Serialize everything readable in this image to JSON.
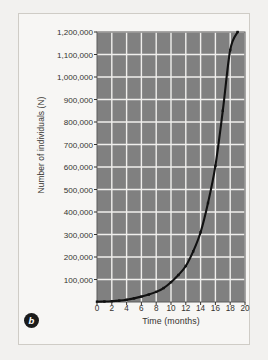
{
  "figure": {
    "panel_label": "b",
    "panel_badge_name": "panel-label-b"
  },
  "chart_data": {
    "type": "line",
    "title": "",
    "subtitle": "",
    "xlabel": "Time (months)",
    "ylabel": "Number of individuals (N)",
    "xlim": [
      0,
      20
    ],
    "ylim": [
      0,
      1200000
    ],
    "grid": true,
    "legend_position": "none",
    "x_tick_labels": [
      "0",
      "2",
      "4",
      "6",
      "8",
      "10",
      "12",
      "14",
      "16",
      "18",
      "20"
    ],
    "x_tick_values": [
      0,
      2,
      4,
      6,
      8,
      10,
      12,
      14,
      16,
      18,
      20
    ],
    "y_tick_labels": [
      "1,200,000",
      "1,100,000",
      "1,000,000",
      "900,000",
      "800,000",
      "700,000",
      "600,000",
      "500,000",
      "400,000",
      "300,000",
      "200,000",
      "100,000"
    ],
    "y_tick_values": [
      1200000,
      1100000,
      1000000,
      900000,
      800000,
      700000,
      600000,
      500000,
      400000,
      300000,
      200000,
      100000
    ],
    "series": [
      {
        "name": "Exponential population growth",
        "marker": "square",
        "color": "#111111",
        "x": [
          0,
          1,
          2,
          3,
          4,
          5,
          6,
          7,
          8,
          9,
          10,
          11,
          12,
          13,
          14,
          15,
          16,
          17,
          18,
          19
        ],
        "values": [
          1000,
          2000,
          3500,
          6000,
          10000,
          16000,
          24000,
          33000,
          45000,
          62000,
          88000,
          120000,
          160000,
          225000,
          310000,
          440000,
          605000,
          850000,
          1120000,
          1200000
        ]
      }
    ],
    "colors": {
      "plot_background": "#808080",
      "gridline": "#f0efed",
      "curve": "#111111",
      "axis_text": "#35332f",
      "figure_background": "#f7f6f4",
      "page_background": "#f2f1ef",
      "frame_border": "#cfccc6"
    }
  }
}
